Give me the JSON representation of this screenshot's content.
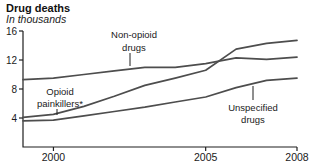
{
  "header": {
    "title": "Drug deaths",
    "subtitle": "In thousands"
  },
  "chart_data": {
    "type": "line",
    "title": "Drug deaths",
    "subtitle": "In thousands",
    "xlabel": "",
    "ylabel": "In thousands",
    "x": [
      1999,
      2000,
      2001,
      2002,
      2003,
      2004,
      2005,
      2006,
      2007,
      2008
    ],
    "series": [
      {
        "name": "Non-opioid drugs",
        "key": "non_opioid_drugs",
        "values": [
          9.3,
          9.5,
          10.0,
          10.5,
          11.0,
          11.0,
          11.5,
          12.3,
          12.1,
          12.4
        ]
      },
      {
        "name": "Opioid painkillers*",
        "key": "opioid_painkillers",
        "values": [
          4.1,
          4.5,
          5.6,
          7.0,
          8.5,
          9.5,
          10.6,
          13.5,
          14.3,
          14.7
        ]
      },
      {
        "name": "Unspecified drugs",
        "key": "unspecified_drugs",
        "values": [
          3.6,
          3.7,
          4.3,
          4.9,
          5.5,
          6.2,
          6.9,
          8.2,
          9.2,
          9.5
        ]
      }
    ],
    "ylim": [
      0,
      16
    ],
    "yticks": [
      16,
      12,
      8,
      4
    ],
    "xticks": [
      2000,
      2005,
      2008
    ],
    "grid": false,
    "legend_position": "inline-annotations",
    "line_color": "#4d4d4d",
    "axis_color": "#1f1f1f",
    "text_color": "#1a1a1a",
    "annotations": [
      {
        "lines": [
          "Non-opioid",
          "drugs"
        ],
        "series": "non_opioid_drugs",
        "cx": 134,
        "baselines": [
          38,
          51
        ],
        "leader": [
          130,
          53,
          130,
          66
        ]
      },
      {
        "lines": [
          "Opioid",
          "painkillers*"
        ],
        "series": "opioid_painkillers",
        "cx": 60,
        "baselines": [
          95,
          107
        ],
        "leader": [
          57,
          109,
          57,
          115
        ]
      },
      {
        "lines": [
          "Unspecified",
          "drugs"
        ],
        "series": "unspecified_drugs",
        "cx": 253,
        "baselines": [
          111,
          123
        ],
        "leader": [
          253,
          86,
          253,
          100
        ]
      }
    ]
  }
}
